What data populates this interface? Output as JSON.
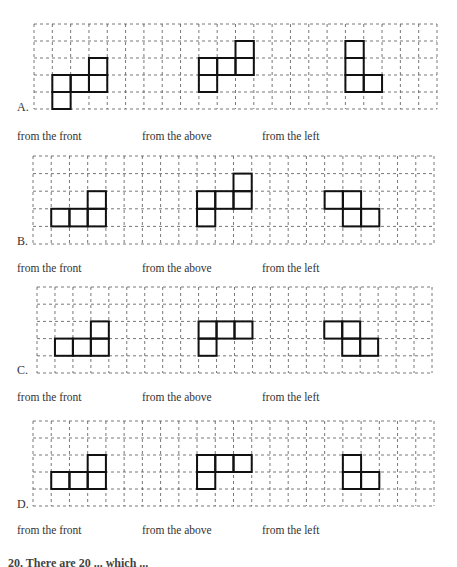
{
  "options": [
    {
      "label": "A.",
      "captions": [
        "from the front",
        "from the above",
        "from the left"
      ],
      "grid": {
        "x": 34,
        "y": 24,
        "w": 403,
        "h": 85,
        "cols": 22,
        "rows": 5
      },
      "views": [
        {
          "name": "front",
          "cells": [
            [
              1,
              3
            ],
            [
              1,
              4
            ],
            [
              2,
              3
            ],
            [
              3,
              2
            ],
            [
              3,
              3
            ]
          ]
        },
        {
          "name": "above",
          "cells": [
            [
              9,
              2
            ],
            [
              9,
              3
            ],
            [
              10,
              2
            ],
            [
              11,
              1
            ],
            [
              11,
              2
            ]
          ]
        },
        {
          "name": "left",
          "cells": [
            [
              17,
              1
            ],
            [
              17,
              2
            ],
            [
              17,
              3
            ],
            [
              18,
              3
            ]
          ]
        }
      ],
      "label_y": 100,
      "caption_y": 130
    },
    {
      "label": "B.",
      "captions": [
        "from the front",
        "from the above",
        "from the left"
      ],
      "grid": {
        "x": 33,
        "y": 156,
        "w": 401,
        "h": 88,
        "cols": 22,
        "rows": 5
      },
      "views": [
        {
          "name": "front",
          "cells": [
            [
              1,
              3
            ],
            [
              2,
              3
            ],
            [
              3,
              3
            ],
            [
              3,
              2
            ]
          ]
        },
        {
          "name": "above",
          "cells": [
            [
              9,
              2
            ],
            [
              9,
              3
            ],
            [
              10,
              2
            ],
            [
              11,
              1
            ],
            [
              11,
              2
            ]
          ]
        },
        {
          "name": "left",
          "cells": [
            [
              16,
              2
            ],
            [
              17,
              2
            ],
            [
              17,
              3
            ],
            [
              18,
              3
            ]
          ]
        }
      ],
      "label_y": 234,
      "caption_y": 262
    },
    {
      "label": "C.",
      "captions": [
        "from the front",
        "from the above",
        "from the left"
      ],
      "grid": {
        "x": 37,
        "y": 287,
        "w": 395,
        "h": 86,
        "cols": 22,
        "rows": 5
      },
      "views": [
        {
          "name": "front",
          "cells": [
            [
              1,
              3
            ],
            [
              2,
              3
            ],
            [
              3,
              3
            ],
            [
              3,
              2
            ]
          ]
        },
        {
          "name": "above",
          "cells": [
            [
              9,
              2
            ],
            [
              10,
              2
            ],
            [
              11,
              2
            ],
            [
              9,
              3
            ]
          ]
        },
        {
          "name": "left",
          "cells": [
            [
              16,
              2
            ],
            [
              17,
              2
            ],
            [
              17,
              3
            ],
            [
              18,
              3
            ]
          ]
        }
      ],
      "label_y": 363,
      "caption_y": 391
    },
    {
      "label": "D.",
      "captions": [
        "from the front",
        "from the above",
        "from the left"
      ],
      "grid": {
        "x": 33,
        "y": 421,
        "w": 401,
        "h": 85,
        "cols": 22,
        "rows": 5
      },
      "views": [
        {
          "name": "front",
          "cells": [
            [
              1,
              3
            ],
            [
              2,
              3
            ],
            [
              3,
              3
            ],
            [
              3,
              2
            ]
          ]
        },
        {
          "name": "above",
          "cells": [
            [
              9,
              2
            ],
            [
              10,
              2
            ],
            [
              11,
              2
            ],
            [
              9,
              3
            ]
          ]
        },
        {
          "name": "left",
          "cells": [
            [
              17,
              2
            ],
            [
              17,
              3
            ],
            [
              18,
              3
            ]
          ]
        }
      ],
      "label_y": 497,
      "caption_y": 524
    }
  ],
  "caption_x": [
    17,
    142,
    262
  ],
  "footer": {
    "text": "20.  There are 20 ... which ..."
  }
}
